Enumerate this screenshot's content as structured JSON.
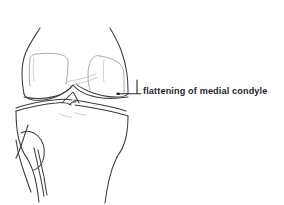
{
  "figure": {
    "kind": "anatomical-line-drawing",
    "background_color": "#ffffff",
    "line_color": "#3a3a42",
    "faint_line_color": "#9a9aa4",
    "width": 284,
    "height": 205
  },
  "annotations": [
    {
      "id": "medial-condyle-flattening",
      "label": "flattening of medial condyle",
      "text_color": "#23232a",
      "leader_color": "#2b2b31",
      "marker_point": {
        "x": 118,
        "y": 94
      },
      "text_point": {
        "x": 143,
        "y": 91
      }
    }
  ],
  "structures": [
    {
      "name": "femoral shaft left cortex",
      "region": "upper-left"
    },
    {
      "name": "femoral shaft right cortex",
      "region": "upper-right"
    },
    {
      "name": "lateral femoral condyle",
      "region": "left-condyle"
    },
    {
      "name": "medial femoral condyle",
      "region": "right-condyle"
    },
    {
      "name": "intercondylar notch",
      "region": "center"
    },
    {
      "name": "tibial plateau",
      "region": "mid"
    },
    {
      "name": "tibial spines",
      "region": "center"
    },
    {
      "name": "tibial shaft",
      "region": "lower"
    },
    {
      "name": "fibular head",
      "region": "lower-left"
    },
    {
      "name": "fibular shaft",
      "region": "lower-left"
    }
  ]
}
